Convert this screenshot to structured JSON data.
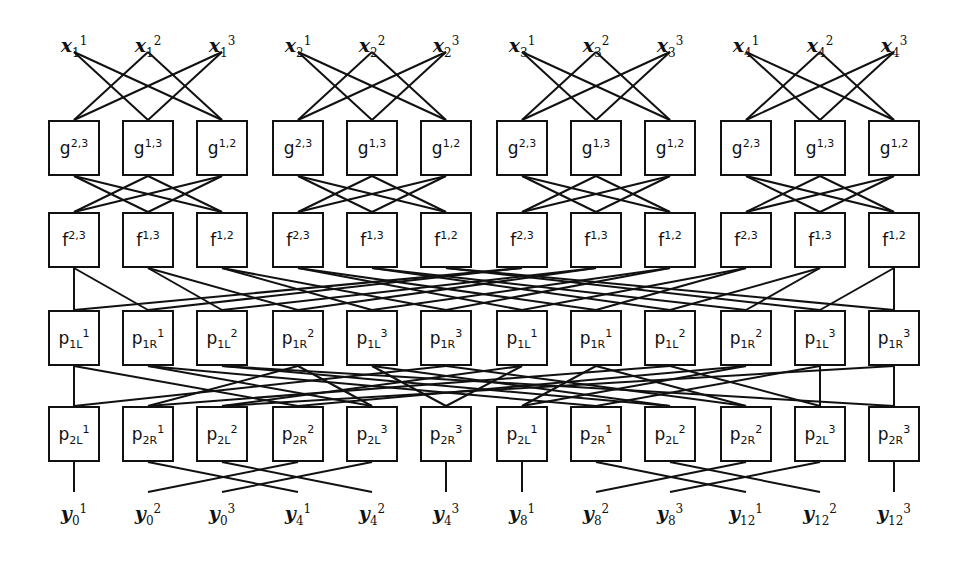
{
  "figure": {
    "type": "butterfly-network-diagram",
    "title": "",
    "columns": 12,
    "groups": 4,
    "columns_per_group": 3,
    "stroke_color": "#111111",
    "background_color": "#ffffff",
    "node_fill": "#ffffff"
  },
  "geometry": {
    "group_x_starts": [
      48,
      272,
      496,
      720
    ],
    "col_step": 74,
    "group_step": 224,
    "box_width": 52,
    "box_height": 56,
    "row_y": {
      "x_labels": 32,
      "g": 120,
      "f": 212,
      "p1": 310,
      "p2": 406,
      "y_labels": 500
    }
  },
  "rows": {
    "inputs": {
      "name": "x-input-row",
      "base": "x",
      "labels": [
        {
          "base": "x",
          "sup": "1",
          "sub": "1"
        },
        {
          "base": "x",
          "sup": "2",
          "sub": "1"
        },
        {
          "base": "x",
          "sup": "3",
          "sub": "1"
        },
        {
          "base": "x",
          "sup": "1",
          "sub": "2"
        },
        {
          "base": "x",
          "sup": "2",
          "sub": "2"
        },
        {
          "base": "x",
          "sup": "3",
          "sub": "2"
        },
        {
          "base": "x",
          "sup": "1",
          "sub": "3"
        },
        {
          "base": "x",
          "sup": "2",
          "sub": "3"
        },
        {
          "base": "x",
          "sup": "3",
          "sub": "3"
        },
        {
          "base": "x",
          "sup": "1",
          "sub": "4"
        },
        {
          "base": "x",
          "sup": "2",
          "sub": "4"
        },
        {
          "base": "x",
          "sup": "3",
          "sub": "4"
        }
      ]
    },
    "g": {
      "name": "g-node-row",
      "base": "g",
      "labels": [
        {
          "base": "g",
          "sup": "2,3"
        },
        {
          "base": "g",
          "sup": "1,3"
        },
        {
          "base": "g",
          "sup": "1,2"
        },
        {
          "base": "g",
          "sup": "2,3"
        },
        {
          "base": "g",
          "sup": "1,3"
        },
        {
          "base": "g",
          "sup": "1,2"
        },
        {
          "base": "g",
          "sup": "2,3"
        },
        {
          "base": "g",
          "sup": "1,3"
        },
        {
          "base": "g",
          "sup": "1,2"
        },
        {
          "base": "g",
          "sup": "2,3"
        },
        {
          "base": "g",
          "sup": "1,3"
        },
        {
          "base": "g",
          "sup": "1,2"
        }
      ]
    },
    "f": {
      "name": "f-node-row",
      "base": "f",
      "labels": [
        {
          "base": "f",
          "sup": "2,3"
        },
        {
          "base": "f",
          "sup": "1,3"
        },
        {
          "base": "f",
          "sup": "1,2"
        },
        {
          "base": "f",
          "sup": "2,3"
        },
        {
          "base": "f",
          "sup": "1,3"
        },
        {
          "base": "f",
          "sup": "1,2"
        },
        {
          "base": "f",
          "sup": "2,3"
        },
        {
          "base": "f",
          "sup": "1,3"
        },
        {
          "base": "f",
          "sup": "1,2"
        },
        {
          "base": "f",
          "sup": "2,3"
        },
        {
          "base": "f",
          "sup": "1,3"
        },
        {
          "base": "f",
          "sup": "1,2"
        }
      ]
    },
    "p1": {
      "name": "p1-node-row",
      "base": "p",
      "labels": [
        {
          "base": "p",
          "sup": "1",
          "sub": "1L"
        },
        {
          "base": "p",
          "sup": "1",
          "sub": "1R"
        },
        {
          "base": "p",
          "sup": "2",
          "sub": "1L"
        },
        {
          "base": "p",
          "sup": "2",
          "sub": "1R"
        },
        {
          "base": "p",
          "sup": "3",
          "sub": "1L"
        },
        {
          "base": "p",
          "sup": "3",
          "sub": "1R"
        },
        {
          "base": "p",
          "sup": "1",
          "sub": "1L"
        },
        {
          "base": "p",
          "sup": "1",
          "sub": "1R"
        },
        {
          "base": "p",
          "sup": "2",
          "sub": "1L"
        },
        {
          "base": "p",
          "sup": "2",
          "sub": "1R"
        },
        {
          "base": "p",
          "sup": "3",
          "sub": "1L"
        },
        {
          "base": "p",
          "sup": "3",
          "sub": "1R"
        }
      ]
    },
    "p2": {
      "name": "p2-node-row",
      "base": "p",
      "labels": [
        {
          "base": "p",
          "sup": "1",
          "sub": "2L"
        },
        {
          "base": "p",
          "sup": "1",
          "sub": "2R"
        },
        {
          "base": "p",
          "sup": "2",
          "sub": "2L"
        },
        {
          "base": "p",
          "sup": "2",
          "sub": "2R"
        },
        {
          "base": "p",
          "sup": "3",
          "sub": "2L"
        },
        {
          "base": "p",
          "sup": "3",
          "sub": "2R"
        },
        {
          "base": "p",
          "sup": "1",
          "sub": "2L"
        },
        {
          "base": "p",
          "sup": "1",
          "sub": "2R"
        },
        {
          "base": "p",
          "sup": "2",
          "sub": "2L"
        },
        {
          "base": "p",
          "sup": "2",
          "sub": "2R"
        },
        {
          "base": "p",
          "sup": "3",
          "sub": "2L"
        },
        {
          "base": "p",
          "sup": "3",
          "sub": "2R"
        }
      ]
    },
    "outputs": {
      "name": "y-output-row",
      "base": "y",
      "labels": [
        {
          "base": "y",
          "sup": "1",
          "sub": "0"
        },
        {
          "base": "y",
          "sup": "2",
          "sub": "0"
        },
        {
          "base": "y",
          "sup": "3",
          "sub": "0"
        },
        {
          "base": "y",
          "sup": "1",
          "sub": "4"
        },
        {
          "base": "y",
          "sup": "2",
          "sub": "4"
        },
        {
          "base": "y",
          "sup": "3",
          "sub": "4"
        },
        {
          "base": "y",
          "sup": "1",
          "sub": "8"
        },
        {
          "base": "y",
          "sup": "2",
          "sub": "8"
        },
        {
          "base": "y",
          "sup": "3",
          "sub": "8"
        },
        {
          "base": "y",
          "sup": "1",
          "sub": "12"
        },
        {
          "base": "y",
          "sup": "2",
          "sub": "12"
        },
        {
          "base": "y",
          "sup": "3",
          "sub": "12"
        }
      ]
    }
  },
  "edges": {
    "x_to_g": {
      "name": "edges-x-to-g",
      "description": "within each group of 3, complete bipartite minus identity",
      "pattern": [
        [
          0,
          1
        ],
        [
          0,
          2
        ],
        [
          1,
          0
        ],
        [
          1,
          2
        ],
        [
          2,
          0
        ],
        [
          2,
          1
        ]
      ],
      "scope": "per-group"
    },
    "g_to_f": {
      "name": "edges-g-to-f",
      "description": "within each group of 3, complete bipartite minus identity",
      "pattern": [
        [
          0,
          1
        ],
        [
          0,
          2
        ],
        [
          1,
          0
        ],
        [
          1,
          2
        ],
        [
          2,
          0
        ],
        [
          2,
          1
        ]
      ],
      "scope": "per-group"
    },
    "f_to_p1": {
      "name": "edges-f-to-p1",
      "description": "stride-2 butterfly across full 12-column width",
      "pairs": [
        [
          0,
          0
        ],
        [
          1,
          2
        ],
        [
          2,
          4
        ],
        [
          3,
          6
        ],
        [
          4,
          8
        ],
        [
          5,
          10
        ],
        [
          6,
          1
        ],
        [
          7,
          3
        ],
        [
          8,
          5
        ],
        [
          9,
          7
        ],
        [
          10,
          9
        ],
        [
          11,
          11
        ],
        [
          0,
          1
        ],
        [
          1,
          3
        ],
        [
          2,
          5
        ],
        [
          3,
          7
        ],
        [
          4,
          9
        ],
        [
          5,
          11
        ],
        [
          6,
          0
        ],
        [
          7,
          2
        ],
        [
          8,
          4
        ],
        [
          9,
          6
        ],
        [
          10,
          8
        ],
        [
          11,
          10
        ]
      ],
      "scope": "global"
    },
    "p1_to_p2": {
      "name": "edges-p1-to-p2",
      "description": "long-range butterfly across full 12-column width",
      "pairs": [
        [
          0,
          0
        ],
        [
          1,
          4
        ],
        [
          2,
          8
        ],
        [
          3,
          1
        ],
        [
          4,
          5
        ],
        [
          5,
          9
        ],
        [
          6,
          2
        ],
        [
          7,
          6
        ],
        [
          8,
          10
        ],
        [
          9,
          3
        ],
        [
          10,
          7
        ],
        [
          11,
          11
        ],
        [
          0,
          3
        ],
        [
          1,
          7
        ],
        [
          2,
          11
        ],
        [
          3,
          4
        ],
        [
          4,
          8
        ],
        [
          5,
          0
        ],
        [
          6,
          5
        ],
        [
          7,
          9
        ],
        [
          8,
          1
        ],
        [
          9,
          6
        ],
        [
          10,
          10
        ],
        [
          11,
          2
        ]
      ],
      "scope": "global"
    },
    "p2_to_y": {
      "name": "edges-p2-to-y",
      "description": "within each group of 3, column 0 straight, columns 1 and 2 swap outward",
      "pairs": [
        [
          0,
          0
        ],
        [
          1,
          3
        ],
        [
          2,
          4
        ],
        [
          3,
          1
        ],
        [
          4,
          2
        ],
        [
          5,
          5
        ],
        [
          6,
          6
        ],
        [
          7,
          9
        ],
        [
          8,
          10
        ],
        [
          9,
          7
        ],
        [
          10,
          8
        ],
        [
          11,
          11
        ]
      ],
      "scope": "global"
    },
    "x_stub_from": 52,
    "y_stub_to": 492
  }
}
